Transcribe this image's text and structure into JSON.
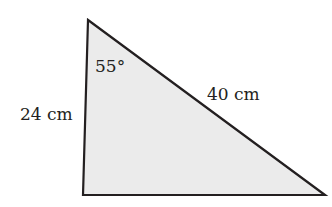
{
  "diagram": {
    "type": "triangle",
    "fill_color": "#ebebeb",
    "stroke_color": "#231f20",
    "vertices": {
      "top": [
        88,
        20
      ],
      "bottom_left": [
        83,
        195
      ],
      "bottom_right": [
        325,
        195
      ]
    },
    "labels": {
      "left_side": "24 cm",
      "hypotenuse": "40 cm",
      "top_angle": "55°"
    }
  }
}
